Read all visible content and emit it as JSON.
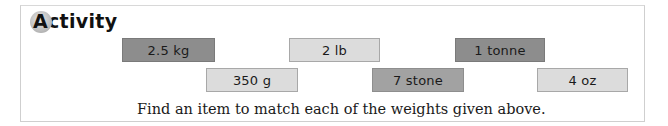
{
  "activity": {
    "heading_initial": "A",
    "heading_rest": "ctivity",
    "instruction": "Find an item to match each of the weights given above."
  },
  "tiles": [
    {
      "label": "2.5 kg",
      "shade": "dark"
    },
    {
      "label": "2 lb",
      "shade": "light"
    },
    {
      "label": "1 tonne",
      "shade": "dark"
    },
    {
      "label": "350 g",
      "shade": "light"
    },
    {
      "label": "7 stone",
      "shade": "mid"
    },
    {
      "label": "4 oz",
      "shade": "light"
    }
  ],
  "colors": {
    "dark": "#8d8d8d",
    "mid": "#a2a2a2",
    "light": "#dcdcdc"
  }
}
